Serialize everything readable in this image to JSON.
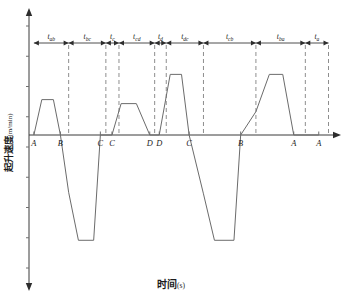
{
  "chart_data": {
    "type": "line",
    "title": "",
    "xlabel": "时间(s)",
    "ylabel": "起升速度(m/min)",
    "xlabel_main": "时间",
    "xlabel_unit": "(s)",
    "ylabel_main": "起升速度",
    "ylabel_unit": "(m/min)",
    "grid": false,
    "legend": "none",
    "axes": {
      "x_range": [
        0,
        10
      ],
      "y_range": [
        -3.1,
        2.6
      ],
      "x_axis_at_y": 0,
      "x_tick_labels_visible": false,
      "y_tick_labels_visible": false,
      "y_tick_count": 9
    },
    "station_markers": [
      {
        "label": "A",
        "x": 0.16
      },
      {
        "label": "B",
        "x": 1.03
      },
      {
        "label": "C",
        "x": 2.34
      },
      {
        "label": "C",
        "x": 2.72
      },
      {
        "label": "D",
        "x": 3.96
      },
      {
        "label": "D",
        "x": 4.27
      },
      {
        "label": "C",
        "x": 5.25
      },
      {
        "label": "B",
        "x": 6.94
      },
      {
        "label": "A",
        "x": 8.68
      },
      {
        "label": "A",
        "x": 9.5
      }
    ],
    "interval_labels": [
      {
        "id": "t_ab",
        "base": "t",
        "sub": "ab",
        "x_start": 0.16,
        "x_end": 1.3
      },
      {
        "id": "t_bc",
        "base": "t",
        "sub": "bc",
        "x_start": 1.3,
        "x_end": 2.52
      },
      {
        "id": "t_c",
        "base": "t",
        "sub": "c",
        "x_start": 2.52,
        "x_end": 2.95
      },
      {
        "id": "t_cd",
        "base": "t",
        "sub": "cd",
        "x_start": 2.95,
        "x_end": 4.12
      },
      {
        "id": "t_d",
        "base": "t",
        "sub": "d",
        "x_start": 4.12,
        "x_end": 4.5
      },
      {
        "id": "t_dc",
        "base": "t",
        "sub": "dc",
        "x_start": 4.5,
        "x_end": 5.72
      },
      {
        "id": "t_cb",
        "base": "t",
        "sub": "cb",
        "x_start": 5.72,
        "x_end": 7.44
      },
      {
        "id": "t_ba",
        "base": "t",
        "sub": "ba",
        "x_start": 7.44,
        "x_end": 9.06
      },
      {
        "id": "t_a",
        "base": "t",
        "sub": "a",
        "x_start": 9.06,
        "x_end": 9.82
      }
    ],
    "dashed_verticals": [
      1.3,
      2.52,
      2.95,
      4.12,
      4.5,
      5.72,
      7.44,
      9.06,
      9.82
    ],
    "series": [
      {
        "name": "hoisting speed profile",
        "points": [
          [
            0.16,
            0.0
          ],
          [
            0.42,
            1.15
          ],
          [
            0.8,
            1.15
          ],
          [
            1.03,
            0.0
          ],
          [
            1.3,
            -1.48
          ],
          [
            1.62,
            -2.72
          ],
          [
            2.12,
            -2.72
          ],
          [
            2.34,
            0.0
          ],
          [
            2.72,
            0.0
          ],
          [
            3.02,
            1.02
          ],
          [
            3.52,
            1.02
          ],
          [
            3.96,
            0.0
          ],
          [
            4.27,
            0.0
          ],
          [
            4.63,
            1.97
          ],
          [
            5.0,
            1.97
          ],
          [
            5.25,
            0.0
          ],
          [
            5.72,
            -1.52
          ],
          [
            6.08,
            -2.72
          ],
          [
            6.72,
            -2.72
          ],
          [
            6.94,
            0.0
          ],
          [
            7.44,
            0.76
          ],
          [
            7.88,
            1.97
          ],
          [
            8.32,
            1.97
          ],
          [
            8.68,
            0.0
          ],
          [
            9.5,
            0.0
          ]
        ]
      }
    ],
    "plateaus": [
      {
        "segment": "t_ab",
        "value": 1.15,
        "sign": "positive"
      },
      {
        "segment": "t_bc",
        "value": -2.72,
        "sign": "negative"
      },
      {
        "segment": "t_cd",
        "value": 1.02,
        "sign": "positive"
      },
      {
        "segment": "t_dc",
        "value": 1.97,
        "sign": "positive"
      },
      {
        "segment": "t_cb",
        "value": -2.72,
        "sign": "negative"
      },
      {
        "segment": "t_ba",
        "value": 1.97,
        "sign": "positive"
      }
    ]
  },
  "colors": {
    "axis": "#3a3a3a",
    "wave": "#6b6b6b",
    "dashed": "#8e8e8e",
    "text": "#1d1d1d",
    "background": "#ffffff"
  }
}
